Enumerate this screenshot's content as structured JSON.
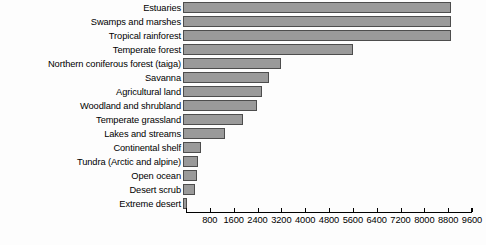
{
  "chart_data": {
    "type": "bar",
    "orientation": "horizontal",
    "title": "",
    "subtitle": "",
    "xlabel": "",
    "ylabel": "",
    "grid": false,
    "legend": null,
    "xlim": [
      0,
      9600
    ],
    "xticks": [
      800,
      1600,
      2400,
      3200,
      4000,
      4800,
      5600,
      6400,
      7200,
      8000,
      8800,
      9600
    ],
    "tick_labels": [
      "800",
      "1600",
      "2400",
      "3200",
      "4000",
      "4800",
      "5600",
      "6400",
      "7200",
      "8000",
      "8800",
      "9600"
    ],
    "categories": [
      "Estuaries",
      "Swamps and marshes",
      "Tropical rainforest",
      "Temperate forest",
      "Northern coniferous forest (taiga)",
      "Savanna",
      "Agricultural land",
      "Woodland and shrubland",
      "Temperate grassland",
      "Lakes and streams",
      "Continental shelf",
      "Tundra (Arctic and alpine)",
      "Open ocean",
      "Desert scrub",
      "Extreme desert"
    ],
    "values": [
      9000,
      9000,
      9000,
      5700,
      3300,
      2900,
      2650,
      2500,
      2000,
      1400,
      600,
      500,
      480,
      400,
      150
    ]
  },
  "style": {
    "bar_fill": "#9a9a9a",
    "bar_border": "#4d4d4d",
    "axis_color": "#000000",
    "background": "#fdfdfd",
    "text_color": "#000000"
  }
}
